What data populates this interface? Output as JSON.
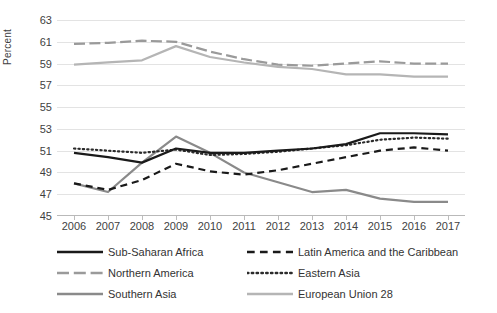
{
  "chart_data": {
    "type": "line",
    "title": "",
    "xlabel": "",
    "ylabel": "Percent",
    "x": [
      2006,
      2007,
      2008,
      2009,
      2010,
      2011,
      2012,
      2013,
      2014,
      2015,
      2016,
      2017
    ],
    "xtick_labels": [
      "2006",
      "2007",
      "2008",
      "2009",
      "2010",
      "2011",
      "2012",
      "2013",
      "2014",
      "2015",
      "2016",
      "2017"
    ],
    "ylim": [
      45,
      63
    ],
    "ytick_labels": [
      "63",
      "61",
      "59",
      "57",
      "55",
      "53",
      "51",
      "49",
      "47",
      "45"
    ],
    "ytick_values": [
      63,
      61,
      59,
      57,
      55,
      53,
      51,
      49,
      47,
      45
    ],
    "grid": true,
    "legend_position": "bottom",
    "series": [
      {
        "name": "Sub-Saharan Africa",
        "style": "solid",
        "color": "#1a1a1a",
        "width": 2.2,
        "values": [
          50.8,
          50.4,
          49.9,
          51.2,
          50.8,
          50.8,
          51.0,
          51.2,
          51.6,
          52.6,
          52.6,
          52.5
        ]
      },
      {
        "name": "Latin America and the Caribbean",
        "style": "dashed",
        "color": "#1a1a1a",
        "width": 2.2,
        "values": [
          48.0,
          47.4,
          48.3,
          49.8,
          49.1,
          48.8,
          49.2,
          49.8,
          50.4,
          51.0,
          51.3,
          51.0
        ]
      },
      {
        "name": "Northern America",
        "style": "long-dash",
        "color": "#9a9a9a",
        "width": 2.2,
        "values": [
          60.8,
          60.9,
          61.1,
          61.0,
          60.1,
          59.4,
          58.9,
          58.8,
          59.0,
          59.2,
          59.0,
          59.0
        ]
      },
      {
        "name": "Eastern Asia",
        "style": "dotted",
        "color": "#2b2b2b",
        "width": 2.2,
        "values": [
          51.2,
          51.0,
          50.8,
          51.1,
          50.6,
          50.7,
          50.9,
          51.2,
          51.5,
          52.0,
          52.2,
          52.1
        ]
      },
      {
        "name": "Southern Asia",
        "style": "solid",
        "color": "#8a8a8a",
        "width": 2.2,
        "values": [
          48.0,
          47.2,
          49.9,
          52.3,
          50.8,
          49.0,
          48.1,
          47.2,
          47.4,
          46.6,
          46.3,
          46.3
        ]
      },
      {
        "name": "European Union 28",
        "style": "solid",
        "color": "#b5b5b5",
        "width": 2.2,
        "values": [
          58.9,
          59.1,
          59.3,
          60.6,
          59.6,
          59.1,
          58.7,
          58.5,
          58.0,
          58.0,
          57.8,
          57.8
        ]
      }
    ]
  },
  "legend": {
    "items": [
      {
        "label": "Sub-Saharan Africa",
        "style": "solid",
        "color": "#1a1a1a"
      },
      {
        "label": "Latin America and the Caribbean",
        "style": "dashed",
        "color": "#1a1a1a"
      },
      {
        "label": "Northern America",
        "style": "long-dash",
        "color": "#9a9a9a"
      },
      {
        "label": "Eastern Asia",
        "style": "dotted",
        "color": "#2b2b2b"
      },
      {
        "label": "Southern Asia",
        "style": "solid",
        "color": "#8a8a8a"
      },
      {
        "label": "European Union 28",
        "style": "solid",
        "color": "#b5b5b5"
      }
    ]
  },
  "colors": {
    "gridline": "#e3e3e3",
    "axis": "#b9b9b9",
    "text": "#3f3f3f",
    "background": "#ffffff"
  }
}
